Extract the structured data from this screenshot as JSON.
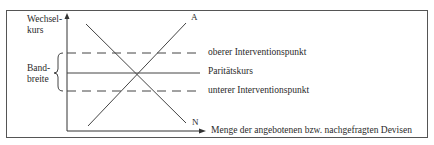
{
  "diagram": {
    "y_axis_label_line1": "Wechsel-",
    "y_axis_label_line2": "kurs",
    "x_axis_label": "Menge der angebotenen bzw. nachgefragten Devisen",
    "band_label_line1": "Band-",
    "band_label_line2": "breite",
    "curve_supply_label": "A",
    "curve_demand_label": "N",
    "lines": {
      "upper": "oberer Interventionspunkt",
      "parity": "Paritätskurs",
      "lower": "unterer Interventionspunkt"
    }
  }
}
